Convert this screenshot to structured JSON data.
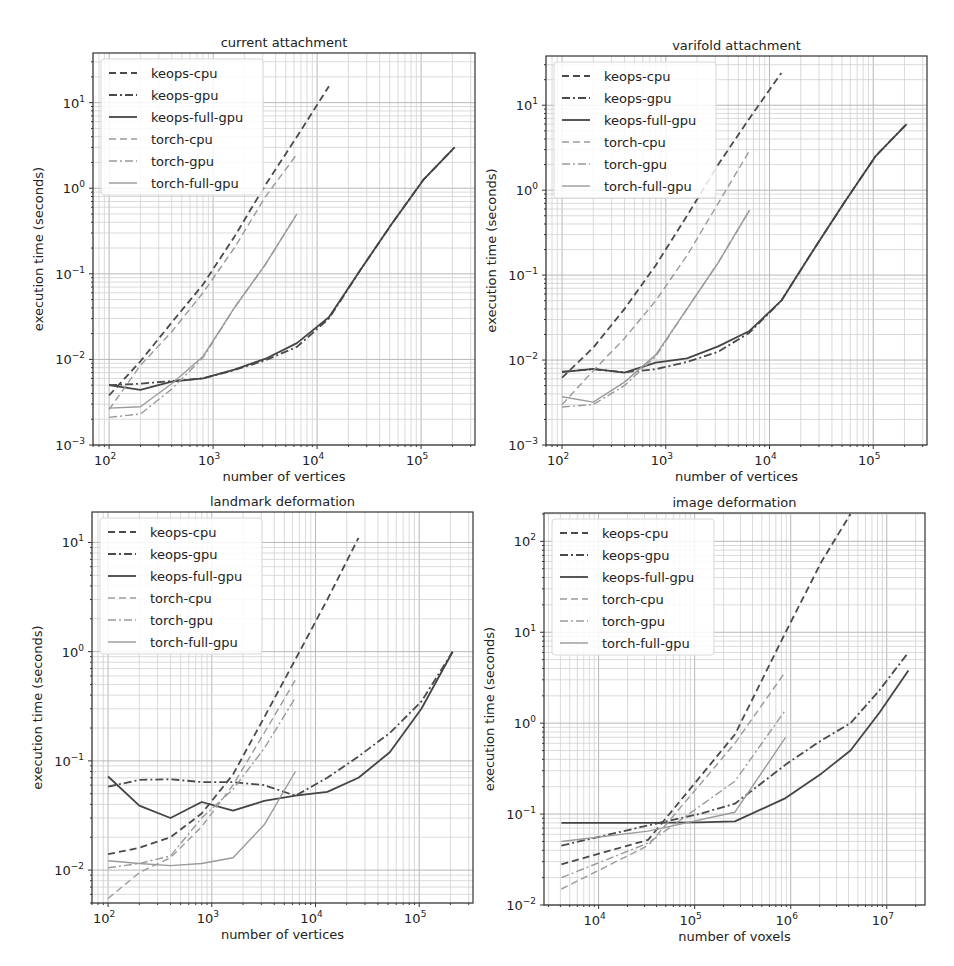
{
  "figure": {
    "width": 954,
    "height": 966
  },
  "styles": {
    "keops-cpu": {
      "color": "#4a4a4a",
      "dash": "7,4",
      "width": 1.8
    },
    "keops-gpu": {
      "color": "#4a4a4a",
      "dash": "8,3,2,3",
      "width": 1.8
    },
    "keops-full-gpu": {
      "color": "#444444",
      "dash": "",
      "width": 1.8
    },
    "torch-cpu": {
      "color": "#9a9a9a",
      "dash": "7,4",
      "width": 1.4
    },
    "torch-gpu": {
      "color": "#9a9a9a",
      "dash": "8,3,2,3",
      "width": 1.4
    },
    "torch-full-gpu": {
      "color": "#9a9a9a",
      "dash": "",
      "width": 1.4
    }
  },
  "chart_data": [
    {
      "type": "line",
      "title": "current attachment",
      "xlabel": "number of vertices",
      "ylabel": "execution time (seconds)",
      "xscale": "log",
      "yscale": "log",
      "xlim": [
        70,
        330000
      ],
      "ylim": [
        0.001,
        38
      ],
      "xticks": [
        {
          "v": 100,
          "label": "10",
          "exp": "2"
        },
        {
          "v": 1000,
          "label": "10",
          "exp": "3"
        },
        {
          "v": 10000,
          "label": "10",
          "exp": "4"
        },
        {
          "v": 100000,
          "label": "10",
          "exp": "5"
        }
      ],
      "yticks": [
        {
          "v": 0.001,
          "label": "10",
          "exp": "−3"
        },
        {
          "v": 0.01,
          "label": "10",
          "exp": "−2"
        },
        {
          "v": 0.1,
          "label": "10",
          "exp": "−1"
        },
        {
          "v": 1,
          "label": "10",
          "exp": "0"
        },
        {
          "v": 10,
          "label": "10",
          "exp": "1"
        }
      ],
      "grid": true,
      "legend_position": "upper left",
      "box": {
        "left": 93,
        "top": 53,
        "right": 475,
        "bottom": 445
      },
      "series": [
        {
          "name": "keops-cpu",
          "x": [
            100,
            200,
            400,
            800,
            1600,
            3200,
            6400,
            13000
          ],
          "y": [
            0.0038,
            0.0095,
            0.027,
            0.075,
            0.27,
            1.1,
            4.0,
            15.5
          ]
        },
        {
          "name": "keops-gpu",
          "x": [
            100,
            200,
            400,
            800,
            1600,
            3200,
            6400,
            13000,
            26000,
            52000,
            105000,
            210000
          ],
          "y": [
            0.005,
            0.0052,
            0.0056,
            0.006,
            0.0075,
            0.0098,
            0.014,
            0.03,
            0.11,
            0.38,
            1.25,
            3.0
          ]
        },
        {
          "name": "keops-full-gpu",
          "x": [
            100,
            200,
            400,
            800,
            1600,
            3200,
            6400,
            13000,
            26000,
            52000,
            105000,
            210000
          ],
          "y": [
            0.005,
            0.0044,
            0.0055,
            0.006,
            0.0076,
            0.0102,
            0.0155,
            0.031,
            0.11,
            0.38,
            1.25,
            3.0
          ]
        },
        {
          "name": "torch-cpu",
          "x": [
            100,
            200,
            400,
            800,
            1600,
            3200,
            6400
          ],
          "y": [
            0.0026,
            0.0085,
            0.021,
            0.06,
            0.2,
            0.8,
            2.5
          ]
        },
        {
          "name": "torch-gpu",
          "x": [
            100,
            200,
            400,
            800,
            1600,
            3200,
            6400
          ],
          "y": [
            0.0021,
            0.0023,
            0.0045,
            0.0105,
            0.04,
            0.13,
            0.5
          ]
        },
        {
          "name": "torch-full-gpu",
          "x": [
            100,
            200,
            400,
            800,
            1600,
            3200,
            6400
          ],
          "y": [
            0.0027,
            0.0028,
            0.0052,
            0.0108,
            0.04,
            0.13,
            0.5
          ]
        }
      ]
    },
    {
      "type": "line",
      "title": "varifold attachment",
      "xlabel": "number of vertices",
      "ylabel": "execution time (seconds)",
      "xscale": "log",
      "yscale": "log",
      "xlim": [
        70,
        330000
      ],
      "ylim": [
        0.001,
        38
      ],
      "xticks": [
        {
          "v": 100,
          "label": "10",
          "exp": "2"
        },
        {
          "v": 1000,
          "label": "10",
          "exp": "3"
        },
        {
          "v": 10000,
          "label": "10",
          "exp": "4"
        },
        {
          "v": 100000,
          "label": "10",
          "exp": "5"
        }
      ],
      "yticks": [
        {
          "v": 0.001,
          "label": "10",
          "exp": "−3"
        },
        {
          "v": 0.01,
          "label": "10",
          "exp": "−2"
        },
        {
          "v": 0.1,
          "label": "10",
          "exp": "−1"
        },
        {
          "v": 1,
          "label": "10",
          "exp": "0"
        },
        {
          "v": 10,
          "label": "10",
          "exp": "1"
        }
      ],
      "grid": true,
      "legend_position": "upper left",
      "box": {
        "left": 546,
        "top": 56,
        "right": 927,
        "bottom": 445
      },
      "series": [
        {
          "name": "keops-cpu",
          "x": [
            100,
            200,
            400,
            800,
            1600,
            3200,
            6400,
            13000
          ],
          "y": [
            0.0062,
            0.014,
            0.04,
            0.13,
            0.5,
            2.0,
            7.0,
            24
          ]
        },
        {
          "name": "keops-gpu",
          "x": [
            100,
            200,
            400,
            800,
            1600,
            3200,
            6400,
            13000,
            26000,
            52000,
            105000,
            210000
          ],
          "y": [
            0.0073,
            0.0078,
            0.0072,
            0.0078,
            0.0095,
            0.0125,
            0.021,
            0.05,
            0.19,
            0.7,
            2.5,
            6.0
          ]
        },
        {
          "name": "keops-full-gpu",
          "x": [
            100,
            200,
            400,
            800,
            1600,
            3200,
            6400,
            13000,
            26000,
            52000,
            105000,
            210000
          ],
          "y": [
            0.0072,
            0.0079,
            0.0071,
            0.0093,
            0.0105,
            0.0145,
            0.022,
            0.05,
            0.19,
            0.7,
            2.5,
            6.0
          ]
        },
        {
          "name": "torch-cpu",
          "x": [
            100,
            200,
            400,
            800,
            1600,
            3200,
            6400
          ],
          "y": [
            0.003,
            0.0075,
            0.018,
            0.05,
            0.17,
            0.7,
            2.9
          ]
        },
        {
          "name": "torch-gpu",
          "x": [
            100,
            200,
            400,
            800,
            1600,
            3200,
            6400
          ],
          "y": [
            0.0028,
            0.003,
            0.005,
            0.011,
            0.04,
            0.14,
            0.58
          ]
        },
        {
          "name": "torch-full-gpu",
          "x": [
            100,
            200,
            400,
            800,
            1600,
            3200,
            6400
          ],
          "y": [
            0.0037,
            0.0032,
            0.0055,
            0.0115,
            0.04,
            0.14,
            0.58
          ]
        }
      ]
    },
    {
      "type": "line",
      "title": "landmark deformation",
      "xlabel": "number of vertices",
      "ylabel": "execution time (seconds)",
      "xscale": "log",
      "yscale": "log",
      "xlim": [
        70,
        330000
      ],
      "ylim": [
        0.005,
        19
      ],
      "xticks": [
        {
          "v": 100,
          "label": "10",
          "exp": "2"
        },
        {
          "v": 1000,
          "label": "10",
          "exp": "3"
        },
        {
          "v": 10000,
          "label": "10",
          "exp": "4"
        },
        {
          "v": 100000,
          "label": "10",
          "exp": "5"
        }
      ],
      "yticks": [
        {
          "v": 0.01,
          "label": "10",
          "exp": "−2"
        },
        {
          "v": 0.1,
          "label": "10",
          "exp": "−1"
        },
        {
          "v": 1,
          "label": "10",
          "exp": "0"
        },
        {
          "v": 10,
          "label": "10",
          "exp": "1"
        }
      ],
      "grid": true,
      "legend_position": "upper left",
      "box": {
        "left": 92,
        "top": 512,
        "right": 473,
        "bottom": 903
      },
      "series": [
        {
          "name": "keops-cpu",
          "x": [
            100,
            200,
            400,
            800,
            1600,
            3200,
            6400,
            13000,
            26000
          ],
          "y": [
            0.014,
            0.016,
            0.02,
            0.033,
            0.075,
            0.25,
            0.85,
            3.0,
            11
          ]
        },
        {
          "name": "keops-gpu",
          "x": [
            100,
            200,
            400,
            800,
            1600,
            3200,
            6400,
            13000,
            26000,
            52000,
            105000,
            210000
          ],
          "y": [
            0.058,
            0.067,
            0.068,
            0.064,
            0.064,
            0.06,
            0.048,
            0.07,
            0.11,
            0.18,
            0.35,
            1.0
          ]
        },
        {
          "name": "keops-full-gpu",
          "x": [
            100,
            200,
            400,
            800,
            1600,
            3200,
            6400,
            13000,
            26000,
            52000,
            105000,
            210000
          ],
          "y": [
            0.072,
            0.039,
            0.03,
            0.042,
            0.035,
            0.043,
            0.048,
            0.052,
            0.07,
            0.12,
            0.3,
            1.0
          ]
        },
        {
          "name": "torch-cpu",
          "x": [
            100,
            200,
            400,
            800,
            1600,
            3200,
            6400
          ],
          "y": [
            0.0055,
            0.0095,
            0.013,
            0.025,
            0.06,
            0.18,
            0.55
          ]
        },
        {
          "name": "torch-gpu",
          "x": [
            100,
            200,
            400,
            800,
            1600,
            3200,
            6400
          ],
          "y": [
            0.0105,
            0.0115,
            0.0135,
            0.03,
            0.055,
            0.13,
            0.38
          ]
        },
        {
          "name": "torch-full-gpu",
          "x": [
            100,
            200,
            400,
            800,
            1600,
            3200,
            6400
          ],
          "y": [
            0.0122,
            0.0115,
            0.011,
            0.0115,
            0.013,
            0.026,
            0.08
          ]
        }
      ]
    },
    {
      "type": "line",
      "title": "image deformation",
      "xlabel": "number of voxels",
      "ylabel": "execution time (seconds)",
      "xscale": "log",
      "yscale": "log",
      "xlim": [
        2700,
        25000000
      ],
      "ylim": [
        0.01,
        205
      ],
      "xticks": [
        {
          "v": 10000,
          "label": "10",
          "exp": "4"
        },
        {
          "v": 100000,
          "label": "10",
          "exp": "5"
        },
        {
          "v": 1000000,
          "label": "10",
          "exp": "6"
        },
        {
          "v": 10000000,
          "label": "10",
          "exp": "7"
        }
      ],
      "yticks": [
        {
          "v": 0.01,
          "label": "10",
          "exp": "−2"
        },
        {
          "v": 0.1,
          "label": "10",
          "exp": "−1"
        },
        {
          "v": 1,
          "label": "10",
          "exp": "0"
        },
        {
          "v": 10,
          "label": "10",
          "exp": "1"
        },
        {
          "v": 100,
          "label": "10",
          "exp": "2"
        }
      ],
      "grid": true,
      "legend_position": "upper left",
      "box": {
        "left": 544,
        "top": 513,
        "right": 925,
        "bottom": 905
      },
      "series": [
        {
          "name": "keops-cpu",
          "x": [
            4096,
            32768,
            262144,
            884736,
            2097152,
            4194304
          ],
          "y": [
            0.028,
            0.052,
            0.75,
            10,
            60,
            200
          ]
        },
        {
          "name": "keops-gpu",
          "x": [
            4096,
            32768,
            110592,
            262144,
            884736,
            2097152,
            4194304,
            8388608,
            16777216
          ],
          "y": [
            0.045,
            0.075,
            0.1,
            0.13,
            0.35,
            0.65,
            1.0,
            2.3,
            6.0
          ]
        },
        {
          "name": "keops-full-gpu",
          "x": [
            4096,
            32768,
            110592,
            262144,
            884736,
            2097152,
            4194304,
            8388608,
            16777216
          ],
          "y": [
            0.08,
            0.08,
            0.081,
            0.083,
            0.15,
            0.28,
            0.5,
            1.3,
            3.8
          ]
        },
        {
          "name": "torch-cpu",
          "x": [
            4096,
            32768,
            262144,
            884736
          ],
          "y": [
            0.015,
            0.045,
            0.6,
            3.7
          ]
        },
        {
          "name": "torch-gpu",
          "x": [
            4096,
            32768,
            262144,
            884736
          ],
          "y": [
            0.02,
            0.048,
            0.23,
            1.4
          ]
        },
        {
          "name": "torch-full-gpu",
          "x": [
            4096,
            32768,
            262144,
            884736
          ],
          "y": [
            0.05,
            0.065,
            0.105,
            0.7
          ]
        }
      ]
    }
  ],
  "legend": {
    "entries": [
      "keops-cpu",
      "keops-gpu",
      "keops-full-gpu",
      "torch-cpu",
      "torch-gpu",
      "torch-full-gpu"
    ]
  }
}
